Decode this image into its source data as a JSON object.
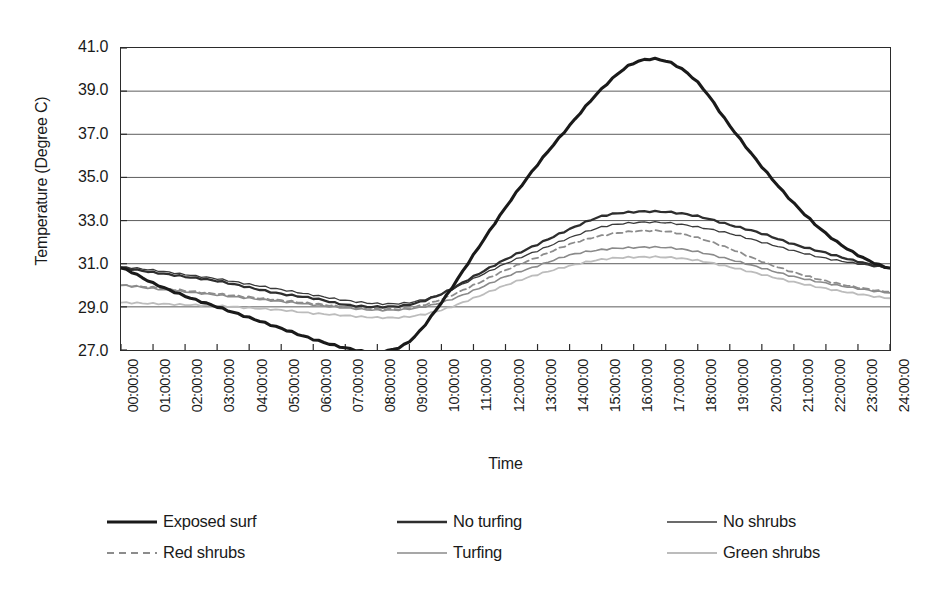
{
  "chart_data": {
    "type": "line",
    "title": "",
    "xlabel": "Time",
    "ylabel": "Temperature (Degree C)",
    "ylim": [
      27.0,
      41.0
    ],
    "ytick_step": 2.0,
    "yticks": [
      "41.0",
      "39.0",
      "37.0",
      "35.0",
      "33.0",
      "31.0",
      "29.0",
      "27.0"
    ],
    "ytick_values": [
      41.0,
      39.0,
      37.0,
      35.0,
      33.0,
      31.0,
      29.0,
      27.0
    ],
    "grid": "horizontal",
    "legend_position": "bottom",
    "categories": [
      "00:00:00",
      "01:00:00",
      "02:00:00",
      "03:00:00",
      "04:00:00",
      "05:00:00",
      "06:00:00",
      "07:00:00",
      "08:00:00",
      "09:00:00",
      "10:00:00",
      "11:00:00",
      "12:00:00",
      "13:00:00",
      "14:00:00",
      "15:00:00",
      "16:00:00",
      "17:00:00",
      "18:00:00",
      "19:00:00",
      "20:00:00",
      "21:00:00",
      "22:00:00",
      "23:00:00",
      "24:00:00"
    ],
    "x": [
      0,
      1,
      2,
      3,
      4,
      5,
      6,
      7,
      8,
      9,
      10,
      11,
      12,
      13,
      14,
      15,
      16,
      17,
      18,
      19,
      20,
      21,
      22,
      23,
      24
    ],
    "series": [
      {
        "name": "Exposed surf",
        "color": "#1a1a1a",
        "width": 3.1,
        "dash": "none",
        "values": [
          30.8,
          30.1,
          29.5,
          29.0,
          28.5,
          28.0,
          27.5,
          27.1,
          26.9,
          27.4,
          29.2,
          31.4,
          33.6,
          35.6,
          37.4,
          39.1,
          40.3,
          40.4,
          39.4,
          37.4,
          35.5,
          33.8,
          32.4,
          31.4,
          30.8
        ]
      },
      {
        "name": "No turfing",
        "color": "#2e2e2e",
        "width": 2.3,
        "dash": "none",
        "values": [
          30.8,
          30.6,
          30.4,
          30.2,
          29.9,
          29.6,
          29.4,
          29.1,
          29.0,
          29.1,
          29.6,
          30.4,
          31.2,
          31.9,
          32.6,
          33.2,
          33.4,
          33.4,
          33.2,
          32.8,
          32.4,
          31.9,
          31.5,
          31.1,
          30.8
        ]
      },
      {
        "name": "No shrubs",
        "color": "#3a3a3a",
        "width": 1.3,
        "dash": "none",
        "values": [
          30.85,
          30.7,
          30.5,
          30.3,
          30.05,
          29.8,
          29.55,
          29.3,
          29.15,
          29.2,
          29.6,
          30.3,
          31.0,
          31.6,
          32.2,
          32.7,
          32.9,
          32.9,
          32.7,
          32.4,
          32.0,
          31.6,
          31.25,
          31.0,
          30.8
        ]
      },
      {
        "name": "Red shrubs",
        "color": "#8c8c8c",
        "width": 1.8,
        "dash": "6,4",
        "values": [
          30.0,
          29.9,
          29.75,
          29.6,
          29.45,
          29.3,
          29.15,
          29.0,
          28.9,
          28.95,
          29.35,
          30.0,
          30.7,
          31.3,
          31.9,
          32.3,
          32.5,
          32.5,
          32.2,
          31.7,
          31.1,
          30.6,
          30.2,
          29.9,
          29.7
        ]
      },
      {
        "name": "Turfing",
        "color": "#8a8a8a",
        "width": 1.6,
        "dash": "none",
        "values": [
          30.0,
          29.85,
          29.7,
          29.55,
          29.4,
          29.25,
          29.1,
          28.95,
          28.85,
          28.9,
          29.2,
          29.75,
          30.4,
          30.9,
          31.4,
          31.65,
          31.75,
          31.75,
          31.55,
          31.2,
          30.8,
          30.4,
          30.1,
          29.85,
          29.65
        ]
      },
      {
        "name": "Green shrubs",
        "color": "#bcbcbc",
        "width": 1.8,
        "dash": "none",
        "values": [
          29.2,
          29.15,
          29.1,
          29.05,
          28.95,
          28.85,
          28.7,
          28.6,
          28.5,
          28.55,
          28.85,
          29.4,
          30.0,
          30.5,
          30.9,
          31.2,
          31.3,
          31.3,
          31.15,
          30.85,
          30.5,
          30.15,
          29.85,
          29.6,
          29.4
        ]
      }
    ]
  },
  "axis": {
    "y_title": "Temperature (Degree C)",
    "x_title": "Time"
  },
  "legend": {
    "items": [
      {
        "label": "Exposed surf",
        "swatch": "thick-black-line-swatch"
      },
      {
        "label": "No turfing",
        "swatch": "medium-black-line-swatch"
      },
      {
        "label": "No shrubs",
        "swatch": "thin-dark-line-swatch"
      },
      {
        "label": "Red shrubs",
        "swatch": "dashed-gray-line-swatch"
      },
      {
        "label": "Turfing",
        "swatch": "medium-gray-line-swatch"
      },
      {
        "label": "Green shrubs",
        "swatch": "light-gray-line-swatch"
      }
    ]
  }
}
